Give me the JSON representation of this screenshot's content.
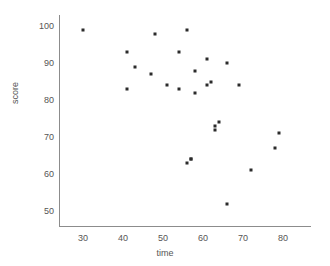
{
  "chart_data": {
    "type": "scatter",
    "title": "",
    "xlabel": "time",
    "ylabel": "score",
    "xlim": [
      24,
      87
    ],
    "ylim": [
      46,
      103
    ],
    "xticks": [
      30,
      40,
      50,
      60,
      70,
      80
    ],
    "yticks": [
      50,
      60,
      70,
      80,
      90,
      100
    ],
    "grid": false,
    "legend": null,
    "marker": "square",
    "marker_color": "#2b2b2b",
    "axis_color": "#8c8c8c",
    "points": [
      {
        "x": 30,
        "y": 99
      },
      {
        "x": 41,
        "y": 93
      },
      {
        "x": 41,
        "y": 83
      },
      {
        "x": 43,
        "y": 89
      },
      {
        "x": 47,
        "y": 87
      },
      {
        "x": 48,
        "y": 98
      },
      {
        "x": 51,
        "y": 84
      },
      {
        "x": 54,
        "y": 93
      },
      {
        "x": 54,
        "y": 83
      },
      {
        "x": 56,
        "y": 99
      },
      {
        "x": 56,
        "y": 63
      },
      {
        "x": 57,
        "y": 64
      },
      {
        "x": 57,
        "y": 64
      },
      {
        "x": 58,
        "y": 88
      },
      {
        "x": 58,
        "y": 82
      },
      {
        "x": 61,
        "y": 91
      },
      {
        "x": 61,
        "y": 84
      },
      {
        "x": 62,
        "y": 85
      },
      {
        "x": 63,
        "y": 73
      },
      {
        "x": 63,
        "y": 72
      },
      {
        "x": 64,
        "y": 74
      },
      {
        "x": 66,
        "y": 90
      },
      {
        "x": 66,
        "y": 52
      },
      {
        "x": 69,
        "y": 84
      },
      {
        "x": 72,
        "y": 61
      },
      {
        "x": 78,
        "y": 67
      },
      {
        "x": 79,
        "y": 71
      }
    ]
  }
}
